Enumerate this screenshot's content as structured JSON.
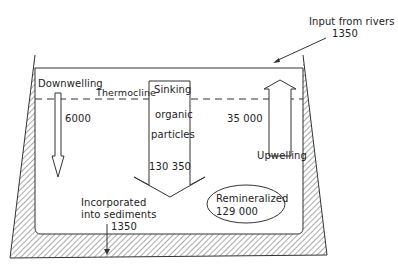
{
  "diagram": {
    "type": "ocean-flux-box",
    "colors": {
      "line": "#333333",
      "hatch": "#555555",
      "background": "#ffffff"
    },
    "labels": {
      "input_rivers_line1": "Input from rivers",
      "input_rivers_value": "1350",
      "downwelling": "Downwelling",
      "downwelling_value": "6000",
      "thermocline": "Thermocline",
      "sinking_line1": "Sinking",
      "sinking_line2": "organic",
      "sinking_line3": "particles",
      "sinking_value": "130 350",
      "upwelling": "Upwelling",
      "upwelling_value": "35 000",
      "sediments_line1": "Incorporated",
      "sediments_line2": "into sediments",
      "sediments_value": "1350",
      "remineralized": "Remineralized",
      "remineralized_value": "129 000"
    }
  }
}
